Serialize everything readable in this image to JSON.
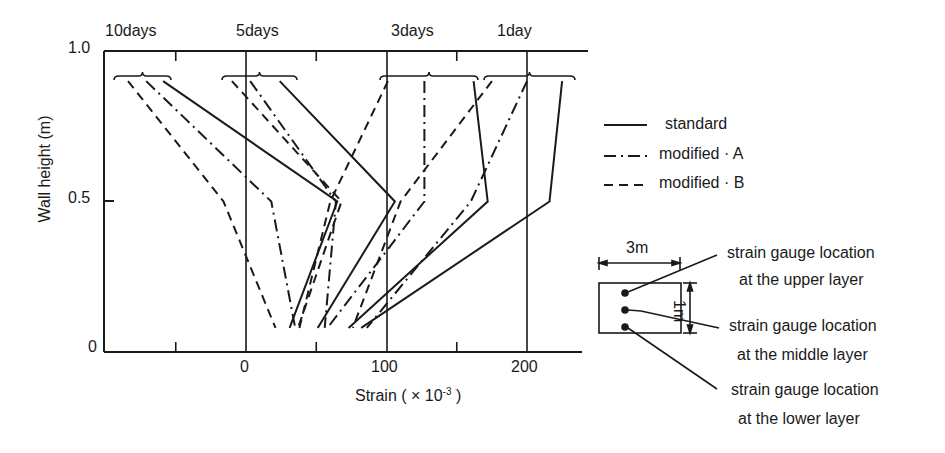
{
  "chart_data": {
    "type": "line",
    "title": "",
    "xlabel": "Strain  ( × 10",
    "xlabel_exp": "-3",
    "xlabel_close": ")",
    "ylabel": "Wall   height (m)",
    "xlim": [
      -100,
      240
    ],
    "ylim": [
      0,
      1.0
    ],
    "x_ticks": [
      0,
      100,
      200
    ],
    "x_minor_ticks": [
      -50,
      50,
      150
    ],
    "y_ticks": [
      0,
      0.5,
      1.0
    ],
    "y_tick_labels": [
      "0",
      "0.5",
      "1.0"
    ],
    "x_tick_labels": [
      "0",
      "100",
      "200"
    ],
    "grid": "vertical reference lines at 0, 100, 200",
    "legend_position": "right",
    "group_labels": [
      "10days",
      "5days",
      "3days",
      "1day"
    ],
    "series": [
      {
        "group": "10days",
        "name": "standard",
        "style": "solid",
        "points": [
          [
            -59,
            0.9
          ],
          [
            65,
            0.5
          ],
          [
            31,
            0.08
          ]
        ]
      },
      {
        "group": "10days",
        "name": "modified · A",
        "style": "dashdot",
        "points": [
          [
            -71,
            0.9
          ],
          [
            18,
            0.5
          ],
          [
            35,
            0.08
          ]
        ]
      },
      {
        "group": "10days",
        "name": "modified · B",
        "style": "dashed",
        "points": [
          [
            -84,
            0.9
          ],
          [
            -16,
            0.5
          ],
          [
            21,
            0.08
          ]
        ]
      },
      {
        "group": "5days",
        "name": "standard",
        "style": "solid",
        "points": [
          [
            24,
            0.9
          ],
          [
            106,
            0.5
          ],
          [
            51,
            0.08
          ]
        ]
      },
      {
        "group": "5days",
        "name": "modified · A",
        "style": "dashdot",
        "points": [
          [
            3,
            0.9
          ],
          [
            64,
            0.5
          ],
          [
            56,
            0.08
          ]
        ]
      },
      {
        "group": "5days",
        "name": "modified · B",
        "style": "dashed",
        "points": [
          [
            -10,
            0.9
          ],
          [
            68,
            0.5
          ],
          [
            37,
            0.08
          ]
        ]
      },
      {
        "group": "3days",
        "name": "standard",
        "style": "solid",
        "points": [
          [
            162,
            0.9
          ],
          [
            172,
            0.5
          ],
          [
            73,
            0.08
          ]
        ]
      },
      {
        "group": "3days",
        "name": "modified · A",
        "style": "dashdot",
        "points": [
          [
            127,
            0.9
          ],
          [
            127,
            0.5
          ],
          [
            58,
            0.08
          ]
        ]
      },
      {
        "group": "3days",
        "name": "modified · B",
        "style": "dashed",
        "points": [
          [
            101,
            0.9
          ],
          [
            60,
            0.5
          ],
          [
            38,
            0.08
          ]
        ]
      },
      {
        "group": "1day",
        "name": "standard",
        "style": "solid",
        "points": [
          [
            225,
            0.9
          ],
          [
            216,
            0.5
          ],
          [
            82,
            0.08
          ]
        ]
      },
      {
        "group": "1day",
        "name": "modified · A",
        "style": "dashdot",
        "points": [
          [
            200,
            0.9
          ],
          [
            160,
            0.5
          ],
          [
            86,
            0.08
          ]
        ]
      },
      {
        "group": "1day",
        "name": "modified · B",
        "style": "dashed",
        "points": [
          [
            175,
            0.9
          ],
          [
            110,
            0.5
          ],
          [
            76,
            0.08
          ]
        ]
      }
    ],
    "legend": [
      {
        "label": "standard",
        "style": "solid"
      },
      {
        "label": "modified · A",
        "style": "dashdot"
      },
      {
        "label": "modified · B",
        "style": "dashed"
      }
    ]
  },
  "inset": {
    "width_label": "3m",
    "height_label": "1m",
    "upper_label_1": "strain gauge location",
    "upper_label_2": "at the upper layer",
    "middle_label_1": "strain gauge location",
    "middle_label_2": "at the middle layer",
    "lower_label_1": "strain gauge location",
    "lower_label_2": "at the lower layer"
  }
}
